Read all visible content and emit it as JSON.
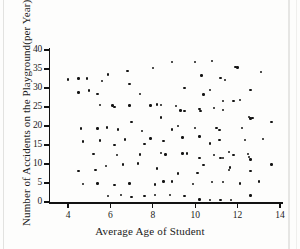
{
  "chart_data": {
    "type": "scatter",
    "title": "",
    "xlabel": "Average Age of Student",
    "ylabel": "Number of Accidents on the Playground(per Year)",
    "xlim": [
      3.2,
      14.2
    ],
    "ylim": [
      0,
      41
    ],
    "xticks": [
      4,
      6,
      8,
      10,
      12,
      14
    ],
    "yticks": [
      0,
      5,
      10,
      15,
      20,
      25,
      30,
      35,
      40
    ],
    "grid": false,
    "legend": null,
    "marker": "filled-circle",
    "marker_color": "#141414",
    "points": [
      [
        4.0,
        32.2
      ],
      [
        4.5,
        32.5
      ],
      [
        4.9,
        32.5
      ],
      [
        5.9,
        33.6
      ],
      [
        6.8,
        34.5
      ],
      [
        8.0,
        35.3
      ],
      [
        8.9,
        36.8
      ],
      [
        10.0,
        36.8
      ],
      [
        10.8,
        37.1
      ],
      [
        11.9,
        35.6
      ],
      [
        12.0,
        35.4
      ],
      [
        13.1,
        34.2
      ],
      [
        4.5,
        28.8
      ],
      [
        5.0,
        29.3
      ],
      [
        5.6,
        31.8
      ],
      [
        6.9,
        31.1
      ],
      [
        9.5,
        30.0
      ],
      [
        10.3,
        33.3
      ],
      [
        10.7,
        29.4
      ],
      [
        11.4,
        32.1
      ],
      [
        11.2,
        32.6
      ],
      [
        12.6,
        29.4
      ],
      [
        5.4,
        28.4
      ],
      [
        6.2,
        25.0
      ],
      [
        7.4,
        28.5
      ],
      [
        8.4,
        25.5
      ],
      [
        9.1,
        25.2
      ],
      [
        10.4,
        28.3
      ],
      [
        11.3,
        26.5
      ],
      [
        11.8,
        26.5
      ],
      [
        12.1,
        26.8
      ],
      [
        5.5,
        25.5
      ],
      [
        6.1,
        25.4
      ],
      [
        6.9,
        25.4
      ],
      [
        7.9,
        25.4
      ],
      [
        8.2,
        25.7
      ],
      [
        9.3,
        24.1
      ],
      [
        9.5,
        23.9
      ],
      [
        10.2,
        24.5
      ],
      [
        10.25,
        24.0
      ],
      [
        10.9,
        24.8
      ],
      [
        11.3,
        24.2
      ],
      [
        12.55,
        22.3
      ],
      [
        12.6,
        22.0
      ],
      [
        12.7,
        22.1
      ],
      [
        4.6,
        19.3
      ],
      [
        5.4,
        19.3
      ],
      [
        5.85,
        19.6
      ],
      [
        6.35,
        19.1
      ],
      [
        7.0,
        21.1
      ],
      [
        7.5,
        18.7
      ],
      [
        8.4,
        22.2
      ],
      [
        8.9,
        19.1
      ],
      [
        9.2,
        20.0
      ],
      [
        10.0,
        19.5
      ],
      [
        11.0,
        19.4
      ],
      [
        11.15,
        18.9
      ],
      [
        12.2,
        19.5
      ],
      [
        13.6,
        21.1
      ],
      [
        4.7,
        15.9
      ],
      [
        5.5,
        16.2
      ],
      [
        6.2,
        15.0
      ],
      [
        6.7,
        16.4
      ],
      [
        7.6,
        15.3
      ],
      [
        7.9,
        16.7
      ],
      [
        8.5,
        16.0
      ],
      [
        9.4,
        17.0
      ],
      [
        10.2,
        17.2
      ],
      [
        10.7,
        15.4
      ],
      [
        11.15,
        16.3
      ],
      [
        11.6,
        13.1
      ],
      [
        12.35,
        16.3
      ],
      [
        13.2,
        16.5
      ],
      [
        5.2,
        12.6
      ],
      [
        6.3,
        12.4
      ],
      [
        7.4,
        12.5
      ],
      [
        8.4,
        12.9
      ],
      [
        8.6,
        12.5
      ],
      [
        9.4,
        12.8
      ],
      [
        9.6,
        12.8
      ],
      [
        10.2,
        11.5
      ],
      [
        10.9,
        12.4
      ],
      [
        11.3,
        11.5
      ],
      [
        11.8,
        12.3
      ],
      [
        12.5,
        12.7
      ],
      [
        12.55,
        11.9
      ],
      [
        12.6,
        11.2
      ],
      [
        4.5,
        8.2
      ],
      [
        5.3,
        8.5
      ],
      [
        5.8,
        9.4
      ],
      [
        6.6,
        9.9
      ],
      [
        7.3,
        10.1
      ],
      [
        8.2,
        8.8
      ],
      [
        8.5,
        5.4
      ],
      [
        9.2,
        7.5
      ],
      [
        10.1,
        7.6
      ],
      [
        10.4,
        9.8
      ],
      [
        11.2,
        11.5
      ],
      [
        11.6,
        8.4
      ],
      [
        11.65,
        9.1
      ],
      [
        12.6,
        8.1
      ],
      [
        13.6,
        9.9
      ],
      [
        4.7,
        4.8
      ],
      [
        5.4,
        4.9
      ],
      [
        6.2,
        4.4
      ],
      [
        6.9,
        4.9
      ],
      [
        8.1,
        4.6
      ],
      [
        8.9,
        5.4
      ],
      [
        9.9,
        4.7
      ],
      [
        10.8,
        5.2
      ],
      [
        11.3,
        5.3
      ],
      [
        12.1,
        4.9
      ],
      [
        13.0,
        5.4
      ],
      [
        5.9,
        1.6
      ],
      [
        6.5,
        1.8
      ],
      [
        7.0,
        1.3
      ],
      [
        7.6,
        1.6
      ],
      [
        8.1,
        1.9
      ],
      [
        8.8,
        1.9
      ],
      [
        9.5,
        1.5
      ],
      [
        10.2,
        0.7
      ],
      [
        10.7,
        0.6
      ],
      [
        11.2,
        0.6
      ],
      [
        11.7,
        0.6
      ],
      [
        12.6,
        1.7
      ]
    ]
  },
  "axes": {
    "x_tick_labels": [
      "4",
      "6",
      "8",
      "10",
      "12",
      "14"
    ],
    "y_tick_labels": [
      "0",
      "5",
      "10",
      "15",
      "20",
      "25",
      "30",
      "35",
      "40"
    ]
  }
}
